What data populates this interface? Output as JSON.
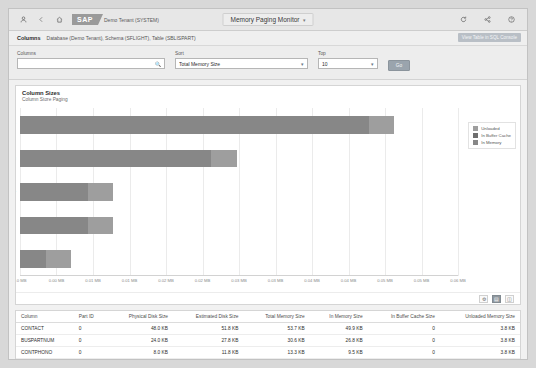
{
  "shellbar": {
    "icons": [
      "person-icon",
      "back-icon",
      "home-icon"
    ],
    "logo_text": "SAP",
    "tenant": "Demo Tenant (SYSTEM)",
    "title": "Memory Paging Monitor",
    "title_chevron": "▾",
    "right_icons": [
      "refresh-icon",
      "share-icon",
      "help-icon"
    ]
  },
  "subheader": {
    "label": "Columns",
    "breadcrumbs": "Database (Demo Tenant), Schema (SFLIGHT), Table (SBLISPART)",
    "view_link": "View Table in SQL Console"
  },
  "filterbar": {
    "columns": {
      "label": "Columns",
      "value": "",
      "placeholder": "",
      "icon": "value-help-icon"
    },
    "sort": {
      "label": "Sort",
      "value": "Total Memory Size",
      "options": [
        "Total Memory Size",
        "Physical Disk Size",
        "Estimated Disk Size",
        "In Memory Size"
      ]
    },
    "top": {
      "label": "Top",
      "value": "10",
      "options": [
        "10",
        "20",
        "50",
        "100"
      ]
    },
    "go_label": "Go"
  },
  "chart_card": {
    "title": "Column Sizes",
    "subtitle": "Column Store Paging",
    "footer_buttons": [
      "settings-icon",
      "bar-chart-icon",
      "table-icon"
    ],
    "selected_footer_button": 1
  },
  "chart_data": {
    "type": "bar",
    "orientation": "horizontal",
    "stacked": true,
    "title": "Column Sizes",
    "subtitle": "Column Store Paging",
    "xlabel": "",
    "ylabel": "",
    "categories": [
      "CONTACT",
      "BUSPARTNUM",
      "CONTPHONO",
      "MANDANT",
      "BUSPRTYP"
    ],
    "tick_labels": [
      "0.0 MB",
      "0.00 MB",
      "0.01 MB",
      "0.01 MB",
      "0.02 MB",
      "0.02 MB",
      "0.03 MB",
      "0.03 MB",
      "0.04 MB",
      "0.04 MB",
      "0.05 MB",
      "0.05 MB",
      "0.06 MB"
    ],
    "xlim": [
      0,
      0.06
    ],
    "unit": "MB",
    "grid": true,
    "legend_position": "right",
    "series": [
      {
        "name": "In Memory",
        "color": "#878787",
        "values": [
          0.0478,
          0.0262,
          0.0093,
          0.0093,
          0.0035
        ]
      },
      {
        "name": "In Buffer Cache",
        "color": "#6f6f6f",
        "values": [
          0.0,
          0.0,
          0.0,
          0.0,
          0.0
        ]
      },
      {
        "name": "Unloaded",
        "color": "#9e9e9e",
        "values": [
          0.0035,
          0.0035,
          0.0035,
          0.0035,
          0.0035
        ]
      }
    ],
    "legend": [
      "Unloaded",
      "In Buffer Cache",
      "In Memory"
    ]
  },
  "table": {
    "columns": [
      "Column",
      "Part ID",
      "Physical Disk Size",
      "Estimated Disk Size",
      "Total Memory Size",
      "In Memory Size",
      "In Buffer Cache Size",
      "Unloaded Memory Size"
    ],
    "rows": [
      [
        "CONTACT",
        "0",
        "48.0 KB",
        "51.8 KB",
        "53.7 KB",
        "49.9 KB",
        "0",
        "3.8 KB"
      ],
      [
        "BUSPARTNUM",
        "0",
        "24.0 KB",
        "27.8 KB",
        "30.6 KB",
        "26.8 KB",
        "0",
        "3.8 KB"
      ],
      [
        "CONTPHONO",
        "0",
        "8.0 KB",
        "11.8 KB",
        "13.3 KB",
        "9.5 KB",
        "0",
        "3.8 KB"
      ]
    ]
  }
}
